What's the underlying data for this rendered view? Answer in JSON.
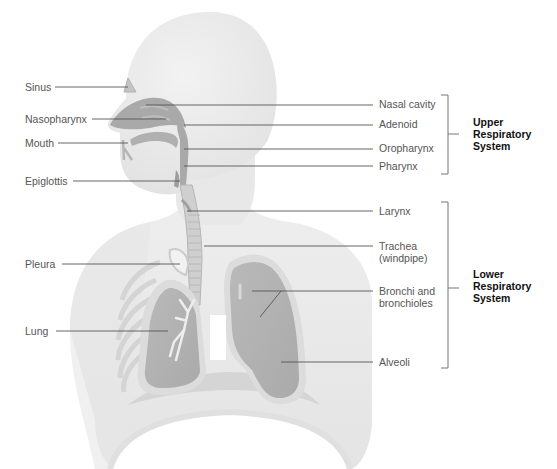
{
  "figure": {
    "title": "Respiratory System",
    "left_labels": [
      {
        "id": "sinus",
        "text": "Sinus"
      },
      {
        "id": "nasopharynx",
        "text": "Nasopharynx"
      },
      {
        "id": "mouth",
        "text": "Mouth"
      },
      {
        "id": "epiglottis",
        "text": "Epiglottis"
      },
      {
        "id": "pleura",
        "text": "Pleura"
      },
      {
        "id": "lung",
        "text": "Lung"
      }
    ],
    "right_labels": [
      {
        "id": "nasal-cavity",
        "text": "Nasal cavity"
      },
      {
        "id": "adenoid",
        "text": "Adenoid"
      },
      {
        "id": "oropharynx",
        "text": "Oropharynx"
      },
      {
        "id": "pharynx",
        "text": "Pharynx"
      },
      {
        "id": "larynx",
        "text": "Larynx"
      },
      {
        "id": "trachea",
        "line1": "Trachea",
        "line2": "(windpipe)"
      },
      {
        "id": "bronchi",
        "line1": "Bronchi and",
        "line2": "bronchioles"
      },
      {
        "id": "alveoli",
        "text": "Alveoli"
      }
    ],
    "groups": {
      "upper": {
        "line1": "Upper",
        "line2": "Respiratory",
        "line3": "System"
      },
      "lower": {
        "line1": "Lower",
        "line2": "Respiratory",
        "line3": "System"
      }
    },
    "colors": {
      "body": "#ececec",
      "body_shadow": "#dedede",
      "airway": "#a9a9a9",
      "lung": "#b4b4b4",
      "lung_outline": "#d2d2d2",
      "leader_line": "#555555",
      "bracket": "#777777",
      "label_text": "#555555",
      "group_text": "#111111"
    }
  }
}
